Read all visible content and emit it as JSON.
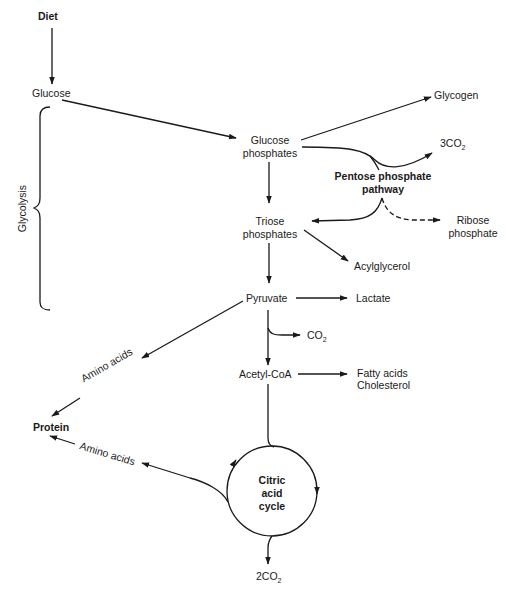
{
  "nodes": {
    "diet": "Diet",
    "glucose": "Glucose",
    "glucose_phosphates_1": "Glucose",
    "glucose_phosphates_2": "phosphates",
    "glycogen": "Glycogen",
    "co2_3": "3CO",
    "co2_3_sub": "2",
    "pentose_1": "Pentose phosphate",
    "pentose_2": "pathway",
    "triose_1": "Triose",
    "triose_2": "phosphates",
    "ribose_1": "Ribose",
    "ribose_2": "phosphate",
    "acylglycerol": "Acylglycerol",
    "pyruvate": "Pyruvate",
    "lactate": "Lactate",
    "co2": "CO",
    "co2_sub": "2",
    "acetyl_coa": "Acetyl-CoA",
    "fatty_acids": "Fatty acids",
    "cholesterol": "Cholesterol",
    "amino_acids_upper": "Amino acids",
    "amino_acids_lower": "Amino acids",
    "protein": "Protein",
    "citric_1": "Citric",
    "citric_2": "acid",
    "citric_3": "cycle",
    "co2_2": "2CO",
    "co2_2_sub": "2"
  },
  "brace_label": "Glycolysis",
  "colors": {
    "ink": "#1a1a1a",
    "background": "#ffffff"
  }
}
